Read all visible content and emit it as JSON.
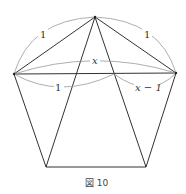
{
  "figure": {
    "caption": "図 10",
    "shape": "regular-pentagon-with-diagonals",
    "vertices": {
      "top": [
        95,
        17
      ],
      "left": [
        14,
        74
      ],
      "right": [
        176,
        73
      ],
      "bottom_left": [
        46,
        167
      ],
      "bottom_right": [
        146,
        167
      ]
    },
    "labels": {
      "upper_left_side": "1",
      "upper_right_side": "1",
      "diagonal": "x",
      "lower_left_segment": "1",
      "lower_right_segment": "x − 1"
    },
    "colors": {
      "stroke": "#333333",
      "arc": "#999999",
      "background": "#ffffff"
    }
  }
}
